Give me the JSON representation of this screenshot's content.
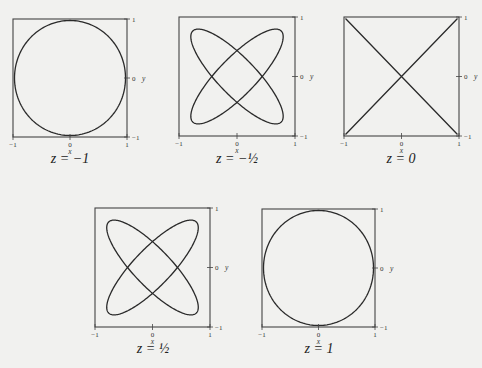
{
  "figure": {
    "panels": [
      {
        "id": "p1",
        "caption": "z = −1",
        "box": [
          13,
          19,
          127,
          137
        ],
        "caption_pos": [
          10,
          160
        ]
      },
      {
        "id": "p2",
        "caption": "z = −½",
        "box": [
          179,
          17,
          295,
          136
        ],
        "caption_pos": [
          177,
          160
        ]
      },
      {
        "id": "p3",
        "caption": "z = 0",
        "box": [
          344,
          17,
          459,
          136
        ],
        "caption_pos": [
          341,
          160
        ]
      },
      {
        "id": "p4",
        "caption": "z = ½",
        "box": [
          95,
          208,
          210,
          327
        ],
        "caption_pos": [
          93,
          350
        ]
      },
      {
        "id": "p5",
        "caption": "z = 1",
        "box": [
          262,
          209,
          375,
          327
        ],
        "caption_pos": [
          259,
          350
        ]
      }
    ],
    "x_axis": {
      "label": "x",
      "ticks": [
        "−1",
        "0",
        "1"
      ]
    },
    "y_axis": {
      "label": "y",
      "ticks": [
        "1",
        "0",
        "−1"
      ]
    }
  },
  "chart_data": [
    {
      "type": "line",
      "title": "z = −1",
      "xlabel": "x",
      "ylabel": "y",
      "xlim": [
        -1,
        1
      ],
      "ylim": [
        -1,
        1
      ],
      "curve": "circle x=cos t, y=sin t"
    },
    {
      "type": "line",
      "title": "z = −1/2",
      "xlabel": "x",
      "ylabel": "y",
      "xlim": [
        -1,
        1
      ],
      "ylim": [
        -1,
        1
      ],
      "curve": "Lissajous four-lobed figure (two crossed ellipses)"
    },
    {
      "type": "line",
      "title": "z = 0",
      "xlabel": "x",
      "ylabel": "y",
      "xlim": [
        -1,
        1
      ],
      "ylim": [
        -1,
        1
      ],
      "curve": "diagonals y=x and y=−x"
    },
    {
      "type": "line",
      "title": "z = 1/2",
      "xlabel": "x",
      "ylabel": "y",
      "xlim": [
        -1,
        1
      ],
      "ylim": [
        -1,
        1
      ],
      "curve": "Lissajous four-lobed figure (two crossed ellipses)"
    },
    {
      "type": "line",
      "title": "z = 1",
      "xlabel": "x",
      "ylabel": "y",
      "xlim": [
        -1,
        1
      ],
      "ylim": [
        -1,
        1
      ],
      "curve": "circle x=cos t, y=sin t"
    }
  ]
}
